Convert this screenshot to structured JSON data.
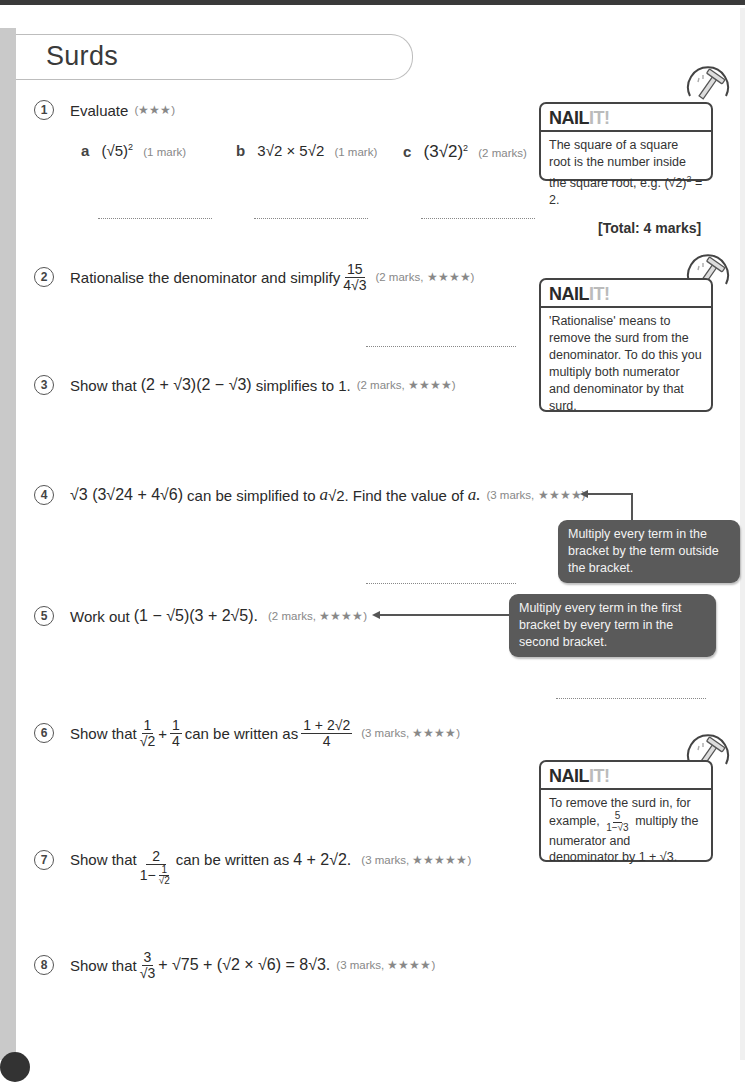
{
  "page": {
    "title": "Surds",
    "total": "[Total: 4 marks]",
    "brand": {
      "nail": "NAIL",
      "it": "IT!"
    }
  },
  "questions": [
    {
      "number": "1",
      "text": "Evaluate",
      "marks": "(★★★)",
      "parts": [
        {
          "label": "a",
          "expr_base": "(√5)",
          "exp": "2",
          "marks": "(1 mark)"
        },
        {
          "label": "b",
          "expr": "3√2 × 5√2",
          "marks": "(1 mark)"
        },
        {
          "label": "c",
          "expr_base": "(3√2)",
          "exp": "2",
          "marks": "(2 marks)"
        }
      ]
    },
    {
      "number": "2",
      "text": "Rationalise the denominator and simplify",
      "frac_num": "15",
      "frac_den": "4√3",
      "marks": "(2 marks, ★★★★)"
    },
    {
      "number": "3",
      "text_before": "Show that",
      "expr": "(2 + √3)(2 − √3)",
      "text_after": "simplifies to 1.",
      "marks": "(2 marks, ★★★★)"
    },
    {
      "number": "4",
      "expr": "√3 (3√24 + 4√6)",
      "text_mid": "can be simplified to",
      "var": "a",
      "expr2": "√2.",
      "text_after": "Find the value of",
      "var2": "a.",
      "marks": "(3 marks, ★★★★)"
    },
    {
      "number": "5",
      "text_before": "Work out",
      "expr": "(1 − √5)(3 + 2√5).",
      "marks": "(2 marks, ★★★★)"
    },
    {
      "number": "6",
      "text_before": "Show that",
      "f1_num": "1",
      "f1_den": "√2",
      "plus": "+",
      "f2_num": "1",
      "f2_den": "4",
      "text_mid": "can be written as",
      "f3_num": "1 + 2√2",
      "f3_den": "4",
      "marks": "(3 marks, ★★★★)"
    },
    {
      "number": "7",
      "text_before": "Show that",
      "f_num": "2",
      "f_den_prefix": "1−",
      "f_den_num": "1",
      "f_den_den": "√2",
      "text_mid": "can be written as",
      "expr": "4 + 2√2.",
      "marks": "(3 marks, ★★★★★)"
    },
    {
      "number": "8",
      "text_before": "Show that",
      "f_num": "3",
      "f_den": "√3",
      "expr": "+ √75 + (√2 × √6) = 8√3.",
      "marks": "(3 marks, ★★★★)"
    }
  ],
  "nail_it_boxes": [
    {
      "text_1": "The square of a square root is the number inside the square root, e.g.",
      "expr_base": "(√2)",
      "exp": "2",
      "text_2": "= 2."
    },
    {
      "text": "'Rationalise' means to remove the surd from the denominator. To do this you multiply both numerator and denominator by that surd."
    },
    {
      "text_1": "To remove the surd in, for example,",
      "f_num": "5",
      "f_den": "1−√3",
      "text_2": "multiply the numerator and denominator by 1 + √3."
    }
  ],
  "tips": [
    {
      "text": "Multiply every term in the bracket by the term outside the bracket."
    },
    {
      "text": "Multiply every term in the first bracket by every term in the second bracket."
    }
  ],
  "colors": {
    "tip_bg": "#5a5a5a",
    "side_strip": "#c9c9c9",
    "border": "#444444"
  }
}
